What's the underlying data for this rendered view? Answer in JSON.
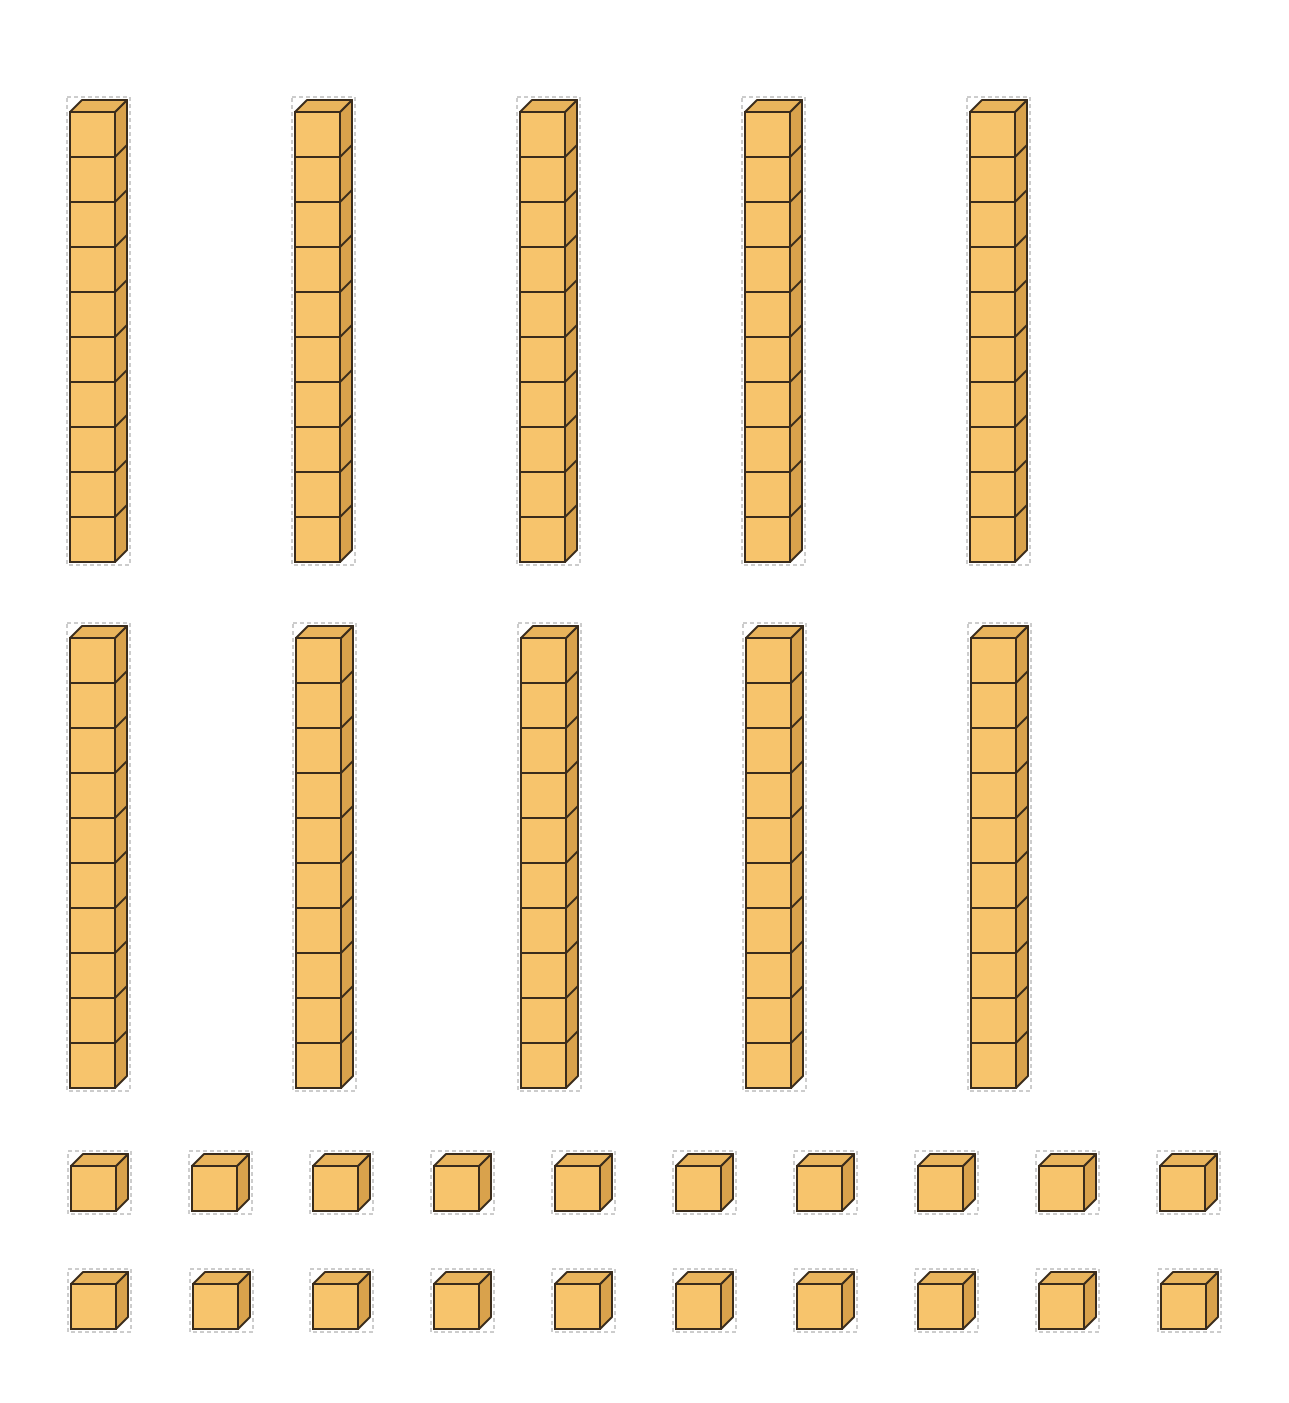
{
  "colors": {
    "front": "#f7c46c",
    "top": "#e9b45c",
    "side": "#d9a24c",
    "outline": "#3a2c1c",
    "cutline": "#9a9a9a",
    "background": "#ffffff"
  },
  "rods": {
    "count": 10,
    "cubes_per_rod": 10,
    "rows": [
      {
        "y_top": 112,
        "x": [
          70,
          295,
          520,
          745,
          970
        ]
      },
      {
        "y_top": 638,
        "x": [
          70,
          296,
          521,
          746,
          971
        ]
      }
    ]
  },
  "units": {
    "count": 20,
    "rows": [
      {
        "y_top": 1166,
        "x": [
          71,
          192,
          313,
          434,
          555,
          676,
          797,
          918,
          1039,
          1160
        ]
      },
      {
        "y_top": 1284,
        "x": [
          71,
          193,
          313,
          434,
          555,
          676,
          797,
          918,
          1039,
          1161
        ]
      }
    ]
  },
  "cube": {
    "face": 45,
    "depth": 12
  }
}
